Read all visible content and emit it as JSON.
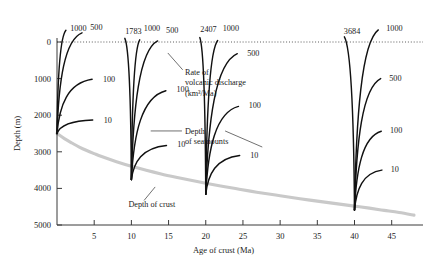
{
  "chart_data": {
    "type": "line",
    "title": "",
    "xlabel": "Age of crust (Ma)",
    "ylabel": "Depth (m)",
    "xlim": [
      0,
      48
    ],
    "ylim": [
      5000,
      -400
    ],
    "y_axis_inverted": true,
    "grid": false,
    "legend": "none",
    "xticks": [
      5,
      10,
      15,
      20,
      25,
      30,
      35,
      40,
      45
    ],
    "yticks": [
      0,
      1000,
      2000,
      3000,
      4000,
      5000
    ],
    "annotations": [
      {
        "name": "discharge-annotation",
        "lines": [
          "Rate of",
          "volcanic discharge",
          "(km³/Ma)"
        ],
        "x": 17.2,
        "y": 900
      },
      {
        "name": "seamount-annotation",
        "lines": [
          "Depth",
          "of seamounts"
        ],
        "x": 17.2,
        "y": 2500
      },
      {
        "name": "crust-annotation",
        "lines": [
          "Depth of crust"
        ],
        "x": 9.6,
        "y": 4500
      }
    ],
    "zero_line": {
      "name": "sea-level-line",
      "value": 0,
      "style": "dotted"
    },
    "crust_curve": {
      "name": "Depth of crust",
      "color": "#c9c9c9",
      "x": [
        0,
        1,
        2,
        3,
        4,
        5,
        6,
        8,
        10,
        12,
        14,
        16,
        18,
        20,
        22,
        24,
        26,
        28,
        30,
        32,
        34,
        36,
        38,
        40,
        42,
        44,
        46,
        48
      ],
      "y": [
        2500,
        2640,
        2760,
        2870,
        2965,
        3050,
        3130,
        3270,
        3395,
        3505,
        3605,
        3695,
        3780,
        3860,
        3935,
        4005,
        4075,
        4140,
        4200,
        4260,
        4320,
        4375,
        4430,
        4485,
        4540,
        4600,
        4660,
        4730
      ]
    },
    "seamount_bundles": [
      {
        "name": "bundle-0Ma",
        "origin_age": 0,
        "origin_depth": 2500,
        "curves": [
          {
            "label": "1000",
            "discharge": 1000,
            "peak_depth": -320,
            "label_x": 1.5,
            "label_y": -380
          },
          {
            "label": "500",
            "discharge": 500,
            "peak_depth": -250,
            "label_x": 4.2,
            "label_y": -400
          },
          {
            "label": "100",
            "discharge": 100,
            "peak_depth": 1020,
            "label_x": 5.9,
            "label_y": 1000
          },
          {
            "label": "10",
            "discharge": 10,
            "peak_depth": 2130,
            "label_x": 6.0,
            "label_y": 2130
          }
        ]
      },
      {
        "name": "bundle-10Ma",
        "origin_age": 10,
        "origin_depth": 3760,
        "curves": [
          {
            "label": "1783",
            "discharge": 1783,
            "peak_depth": -100,
            "label_x": 8.9,
            "label_y": -300
          },
          {
            "label": "1000",
            "discharge": 1000,
            "peak_depth": -60,
            "label_x": 11.4,
            "label_y": -370
          },
          {
            "label": "500",
            "discharge": 500,
            "peak_depth": -30,
            "label_x": 14.4,
            "label_y": -330
          },
          {
            "label": "100",
            "discharge": 100,
            "peak_depth": 1330,
            "label_x": 15.8,
            "label_y": 1290
          },
          {
            "label": "10",
            "discharge": 10,
            "peak_depth": 2830,
            "label_x": 15.9,
            "label_y": 2800
          }
        ]
      },
      {
        "name": "bundle-20Ma",
        "origin_age": 20,
        "origin_depth": 4160,
        "curves": [
          {
            "label": "2407",
            "discharge": 2407,
            "peak_depth": -120,
            "label_x": 19.0,
            "label_y": -350
          },
          {
            "label": "1000",
            "discharge": 1000,
            "peak_depth": -40,
            "label_x": 22.0,
            "label_y": -370
          },
          {
            "label": "500",
            "discharge": 500,
            "peak_depth": 320,
            "label_x": 25.3,
            "label_y": 300
          },
          {
            "label": "100",
            "discharge": 100,
            "peak_depth": 1760,
            "label_x": 25.5,
            "label_y": 1730
          },
          {
            "label": "10",
            "discharge": 10,
            "peak_depth": 3100,
            "label_x": 25.7,
            "label_y": 3080
          }
        ]
      },
      {
        "name": "bundle-40Ma",
        "origin_age": 40,
        "origin_depth": 4590,
        "curves": [
          {
            "label": "3684",
            "discharge": 3684,
            "peak_depth": -140,
            "label_x": 38.3,
            "label_y": -300
          },
          {
            "label": "1000",
            "discharge": 1000,
            "peak_depth": -330,
            "label_x": 44.0,
            "label_y": -390
          },
          {
            "label": "500",
            "discharge": 500,
            "peak_depth": 1000,
            "label_x": 44.4,
            "label_y": 980
          },
          {
            "label": "100",
            "discharge": 100,
            "peak_depth": 2440,
            "label_x": 44.5,
            "label_y": 2400
          },
          {
            "label": "10",
            "discharge": 10,
            "peak_depth": 3500,
            "label_x": 44.6,
            "label_y": 3470
          }
        ]
      }
    ]
  },
  "figure": {
    "colors": {
      "seamount": "#111111",
      "crust": "#c9c9c9",
      "axis": "#3a3a3a",
      "background": "#ffffff"
    }
  }
}
